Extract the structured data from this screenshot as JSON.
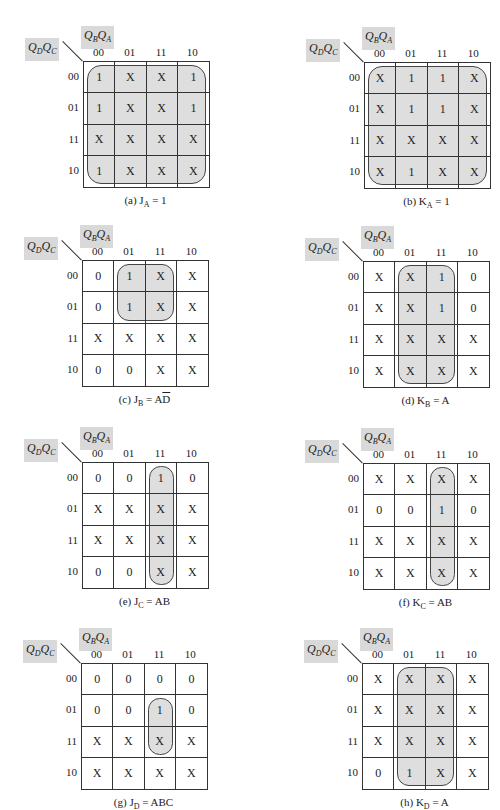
{
  "row_var_label": "QDQC",
  "col_var_label": "QBQA",
  "col_headers": [
    "00",
    "01",
    "11",
    "10"
  ],
  "row_headers": [
    "00",
    "01",
    "11",
    "10"
  ],
  "maps": [
    {
      "id": "a",
      "caption_prefix": "(a) J",
      "caption_sub": "A",
      "caption_rhs": "= 1",
      "cells": [
        [
          "1",
          "X",
          "X",
          "1"
        ],
        [
          "1",
          "X",
          "X",
          "1"
        ],
        [
          "X",
          "X",
          "X",
          "X"
        ],
        [
          "1",
          "X",
          "X",
          "X"
        ]
      ],
      "loop": {
        "c0": 0,
        "c1": 3,
        "r0": 0,
        "r1": 3
      }
    },
    {
      "id": "b",
      "caption_prefix": "(b) K",
      "caption_sub": "A",
      "caption_rhs": "= 1",
      "cells": [
        [
          "X",
          "1",
          "1",
          "X"
        ],
        [
          "X",
          "1",
          "1",
          "X"
        ],
        [
          "X",
          "X",
          "X",
          "X"
        ],
        [
          "X",
          "1",
          "X",
          "X"
        ]
      ],
      "loop": {
        "c0": 0,
        "c1": 3,
        "r0": 0,
        "r1": 3
      }
    },
    {
      "id": "c",
      "caption_prefix": "(c) J",
      "caption_sub": "B",
      "caption_rhs": "= A",
      "caption_over": "D",
      "cells": [
        [
          "0",
          "1",
          "X",
          "X"
        ],
        [
          "0",
          "1",
          "X",
          "X"
        ],
        [
          "X",
          "X",
          "X",
          "X"
        ],
        [
          "0",
          "0",
          "X",
          "X"
        ]
      ],
      "loop": {
        "c0": 1,
        "c1": 2,
        "r0": 0,
        "r1": 1
      }
    },
    {
      "id": "d",
      "caption_prefix": "(d) K",
      "caption_sub": "B",
      "caption_rhs": "= A",
      "cells": [
        [
          "X",
          "X",
          "1",
          "0"
        ],
        [
          "X",
          "X",
          "1",
          "0"
        ],
        [
          "X",
          "X",
          "X",
          "X"
        ],
        [
          "X",
          "X",
          "X",
          "X"
        ]
      ],
      "loop": {
        "c0": 1,
        "c1": 2,
        "r0": 0,
        "r1": 3
      }
    },
    {
      "id": "e",
      "caption_prefix": "(e) J",
      "caption_sub": "C",
      "caption_rhs": "= AB",
      "cells": [
        [
          "0",
          "0",
          "1",
          "0"
        ],
        [
          "X",
          "X",
          "X",
          "X"
        ],
        [
          "X",
          "X",
          "X",
          "X"
        ],
        [
          "0",
          "0",
          "X",
          "X"
        ]
      ],
      "loop": {
        "c0": 2,
        "c1": 2,
        "r0": 0,
        "r1": 3
      }
    },
    {
      "id": "f",
      "caption_prefix": "(f) K",
      "caption_sub": "C",
      "caption_rhs": "= AB",
      "cells": [
        [
          "X",
          "X",
          "X",
          "X"
        ],
        [
          "0",
          "0",
          "1",
          "0"
        ],
        [
          "X",
          "X",
          "X",
          "X"
        ],
        [
          "X",
          "X",
          "X",
          "X"
        ]
      ],
      "loop": {
        "c0": 2,
        "c1": 2,
        "r0": 0,
        "r1": 3
      }
    },
    {
      "id": "g",
      "caption_prefix": "(g) J",
      "caption_sub": "D",
      "caption_rhs": "= ABC",
      "cells": [
        [
          "0",
          "0",
          "0",
          "0"
        ],
        [
          "0",
          "0",
          "1",
          "0"
        ],
        [
          "X",
          "X",
          "X",
          "X"
        ],
        [
          "X",
          "X",
          "X",
          "X"
        ]
      ],
      "loop": {
        "c0": 2,
        "c1": 2,
        "r0": 1,
        "r1": 2
      }
    },
    {
      "id": "h",
      "caption_prefix": "(h) K",
      "caption_sub": "D",
      "caption_rhs": "= A",
      "cells": [
        [
          "X",
          "X",
          "X",
          "X"
        ],
        [
          "X",
          "X",
          "X",
          "X"
        ],
        [
          "X",
          "X",
          "X",
          "X"
        ],
        [
          "0",
          "1",
          "X",
          "X"
        ]
      ],
      "loop": {
        "c0": 1,
        "c1": 2,
        "r0": 0,
        "r1": 3
      }
    }
  ]
}
